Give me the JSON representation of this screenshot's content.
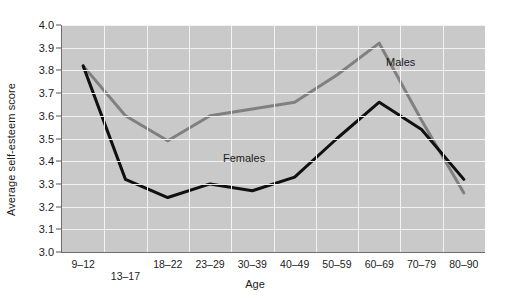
{
  "chart_data": {
    "type": "line",
    "title": "",
    "xlabel": "Age",
    "ylabel": "Average self-esteem score",
    "categories": [
      "9–12",
      "13–17",
      "18–22",
      "23–29",
      "30–39",
      "40–49",
      "50–59",
      "60–69",
      "70–79",
      "80–90"
    ],
    "ylim": [
      3.0,
      4.0
    ],
    "yticks": [
      "3.0",
      "3.1",
      "3.2",
      "3.3",
      "3.4",
      "3.5",
      "3.6",
      "3.7",
      "3.8",
      "3.9",
      "4.0"
    ],
    "ytick_values": [
      3.0,
      3.1,
      3.2,
      3.3,
      3.4,
      3.5,
      3.6,
      3.7,
      3.8,
      3.9,
      4.0
    ],
    "grid": true,
    "legend_position": "inline-annotations",
    "series": [
      {
        "name": "Males",
        "color": "#808080",
        "values": [
          3.82,
          3.6,
          3.49,
          3.6,
          3.63,
          3.66,
          3.78,
          3.92,
          3.58,
          3.26
        ]
      },
      {
        "name": "Females",
        "color": "#101010",
        "values": [
          3.82,
          3.32,
          3.24,
          3.3,
          3.27,
          3.33,
          3.5,
          3.66,
          3.54,
          3.32
        ]
      }
    ],
    "annotations": [
      {
        "text": "Males",
        "x_px": 386,
        "y_px": 56
      },
      {
        "text": "Females",
        "x_px": 223,
        "y_px": 152
      }
    ]
  },
  "colors": {
    "plot_background": "#c9c9c9",
    "grid": "#f2f2f2",
    "axis": "#6e6e6e",
    "text": "#1b1b1b",
    "males": "#808080",
    "females": "#101010"
  }
}
